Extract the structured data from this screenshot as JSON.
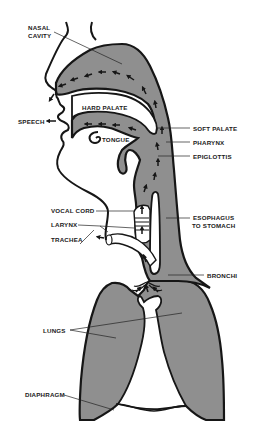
{
  "diagram": {
    "type": "anatomical cross-section",
    "colors": {
      "fill": "#8f8f8f",
      "outline": "#161616",
      "background": "#ffffff",
      "cavity": "#ffffff"
    },
    "labels": {
      "nasal_cavity_1": "NASAL",
      "nasal_cavity_2": "CAVITY",
      "hard_palate": "HARD PALATE",
      "speech": "SPEECH",
      "tongue": "TONGUE",
      "soft_palate": "SOFT PALATE",
      "pharynx": "PHARYNX",
      "epiglottis": "EPIGLOTTIS",
      "vocal_cord": "VOCAL CORD",
      "larynx": "LARYNX",
      "trachea": "TRACHEA",
      "esophagus_1": "ESOPHAGUS",
      "esophagus_2": "TO STOMACH",
      "bronchi": "BRONCHI",
      "lungs": "LUNGS",
      "diaphragm": "DIAPHRAGM"
    },
    "arrows": {
      "speech_arrow": "←"
    }
  }
}
